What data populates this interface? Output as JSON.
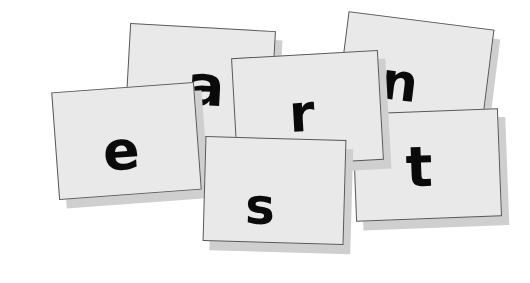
{
  "scene": {
    "title": "letter-tiles",
    "background_color": "#ffffff",
    "width": 530,
    "height": 283,
    "card_fill_color": "#e9e9e9",
    "card_border_color": "#585858",
    "card_shadow_color": "#cfcfcf",
    "letter_color": "#0a0a0a"
  },
  "cards": [
    {
      "id": "card-a",
      "letter": "a",
      "rotation_deg": 3.2,
      "z_order": 1,
      "x": 127,
      "y": 27,
      "width": 146,
      "height": 110
    },
    {
      "id": "card-n",
      "letter": "n",
      "rotation_deg": 7.2,
      "z_order": 2,
      "x": 341,
      "y": 20,
      "width": 147,
      "height": 112
    },
    {
      "id": "card-e",
      "letter": "e",
      "rotation_deg": -4.2,
      "z_order": 3,
      "x": 55,
      "y": 87,
      "width": 143,
      "height": 108
    },
    {
      "id": "card-t",
      "letter": "t",
      "rotation_deg": -2.2,
      "z_order": 4,
      "x": 354,
      "y": 111,
      "width": 146,
      "height": 108
    },
    {
      "id": "card-r",
      "letter": "r",
      "rotation_deg": -3.2,
      "z_order": 5,
      "x": 234,
      "y": 54,
      "width": 147,
      "height": 110
    },
    {
      "id": "card-s",
      "letter": "s",
      "rotation_deg": 1.6,
      "z_order": 6,
      "x": 204,
      "y": 138,
      "width": 141,
      "height": 105
    }
  ]
}
